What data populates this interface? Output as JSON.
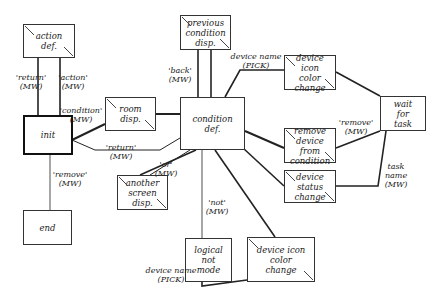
{
  "nodes": [
    {
      "id": "action_def",
      "label": "action\ndef."
    },
    {
      "id": "init",
      "label": "init"
    },
    {
      "id": "end",
      "label": "end"
    },
    {
      "id": "room_disp",
      "label": "room\ndisp."
    },
    {
      "id": "condition_def",
      "label": "condition\ndef."
    },
    {
      "id": "previous_condition_disp",
      "label": "previous\ncondition\ndisp."
    },
    {
      "id": "device_icon_color_change_top",
      "label": "device\nicon\ncolor\nchange"
    },
    {
      "id": "wait_for_task",
      "label": "wait\nfor\ntask"
    },
    {
      "id": "remove_device_from_condition",
      "label": "remove\ndevice\nfrom\ncondition"
    },
    {
      "id": "device_status_change",
      "label": "device\nstatus\nchange"
    },
    {
      "id": "another_screen_disp",
      "label": "another\nscreen\ndisp."
    },
    {
      "id": "logical_not_mode",
      "label": "logical\nnot\nmode"
    },
    {
      "id": "device_icon_color_change_bottom",
      "label": "device  icon\ncolor\nchange"
    }
  ],
  "edge_labels": {
    "return_action": "'return'\n(MW)",
    "action": "'action'\n(MW)",
    "condition": "'condition'\n(MW)",
    "return_cond": "'return'\n(MW)",
    "remove_end": "'remove'\n(MW)",
    "back": "'back'\n(MW)",
    "device_name_top": "device  name\n(PICK)",
    "remove_wait": "'remove'\n(MW)",
    "task_name": "task\nname\n(MW)",
    "or": "'or'\n(MW)",
    "not": "'not'\n(MW)",
    "device_name_bottom": "device  name\n(PICK)"
  }
}
